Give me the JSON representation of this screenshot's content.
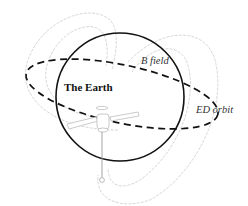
{
  "diagram": {
    "labels": {
      "earth": "The Earth",
      "b_field": "B field",
      "ed_orbit": "ED orbit"
    },
    "elements": {
      "earth": {
        "shape": "circle",
        "stroke": "#111111"
      },
      "orbit": {
        "shape": "dashed-ellipse",
        "stroke": "#111111"
      },
      "field_lines": {
        "shape": "dipole-loops",
        "stroke": "#cfcfcf",
        "count": 4
      },
      "spacecraft": {
        "shape": "satellite-with-solar-panels",
        "stroke": "#bdbdbd"
      },
      "tether": {
        "shape": "vertical-line-with-end-mass",
        "stroke": "#9a9a9a"
      }
    },
    "colors": {
      "background": "#ffffff",
      "primary_stroke": "#111111",
      "field_line": "#d0d0d0",
      "spacecraft": "#bbbbbb"
    }
  }
}
